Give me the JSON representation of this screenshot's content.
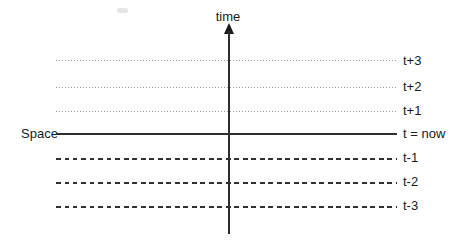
{
  "diagram": {
    "time_axis_label": "time",
    "space_axis_label": "Space",
    "rows": [
      {
        "label": "t+3",
        "style": "dotted"
      },
      {
        "label": "t+2",
        "style": "dotted"
      },
      {
        "label": "t+1",
        "style": "dotted"
      },
      {
        "label": "t = now",
        "style": "solid"
      },
      {
        "label": "t-1",
        "style": "dashed"
      },
      {
        "label": "t-2",
        "style": "dashed"
      },
      {
        "label": "t-3",
        "style": "dashed"
      }
    ],
    "colors": {
      "background": "#ffffff",
      "axis_line": "#2e2e2e",
      "solid_line": "#2e2e2e",
      "dashed_line": "#303030",
      "dotted_line": "#9b9b9b",
      "text": "#1a1a1a"
    }
  }
}
